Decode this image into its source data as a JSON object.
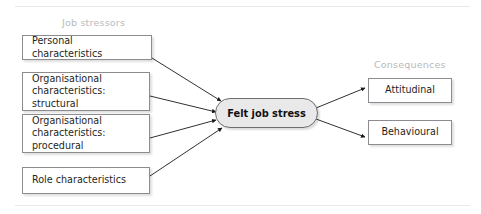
{
  "diagram": {
    "title_not_shown": "",
    "groups": [
      {
        "label": "Job stressors"
      },
      {
        "label": "Consequences"
      }
    ],
    "stressors": [
      {
        "label": "Personal characteristics"
      },
      {
        "line1": "Organisational",
        "line2": "characteristics:",
        "line3": "structural"
      },
      {
        "line1": "Organisational",
        "line2": "characteristics:",
        "line3": "procedural"
      },
      {
        "label": "Role characteristics"
      }
    ],
    "center": {
      "label": "Felt job stress"
    },
    "consequences": [
      {
        "label": "Attitudinal"
      },
      {
        "label": "Behavioural"
      }
    ],
    "colors": {
      "box_border": "#8c8c90",
      "box_fill": "#ffffff",
      "pill_fill": "#e9e9ea",
      "pill_border": "#6e6e72",
      "arrow": "#1a1a1a",
      "group_label": "#b9b9bd",
      "rule": "#e8e8ea",
      "text": "#1f1f22"
    }
  }
}
